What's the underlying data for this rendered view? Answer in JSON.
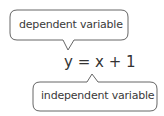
{
  "diagram": {
    "top_label": "dependent variable",
    "equation": "y = x + 1",
    "bottom_label": "independent variable"
  }
}
